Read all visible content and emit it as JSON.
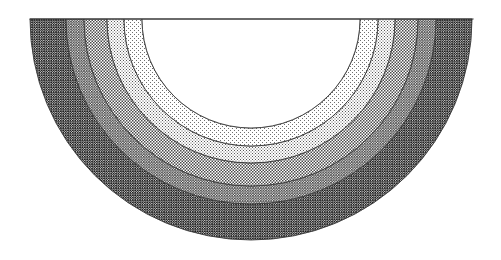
{
  "figure": {
    "title": "Semicircular zoned cross-section",
    "shape": "half-annulus",
    "orientation": "downward half-disc",
    "background_color": "#ffffff",
    "outline_color": "#3a3a3a",
    "center_x": 251,
    "center_y": 19,
    "top_rule_label": "diameter-line",
    "top_rule": {
      "x1": 30,
      "x2": 473,
      "y": 19
    },
    "inner_core": {
      "label": "unshaded inner core",
      "fill": "#ffffff",
      "radius": 109
    },
    "bands": [
      {
        "index": 1,
        "label": "zone-1-lightest",
        "pattern": "sparse-dot",
        "fill_id": "pat-dots-sparse",
        "tone": "#f2f2f2",
        "inner_radius": 109,
        "outer_radius": 127
      },
      {
        "index": 2,
        "label": "zone-2-light",
        "pattern": "fine-dot",
        "fill_id": "pat-dots-fine",
        "tone": "#e0e0e0",
        "inner_radius": 127,
        "outer_radius": 144
      },
      {
        "index": 3,
        "label": "zone-3-medium",
        "pattern": "medium-checker",
        "fill_id": "pat-check-medium",
        "tone": "#c2c2c2",
        "inner_radius": 144,
        "outer_radius": 167
      },
      {
        "index": 4,
        "label": "zone-4-dark",
        "pattern": "dense-checker",
        "fill_id": "pat-check-dense",
        "tone": "#8a8a8a",
        "inner_radius": 167,
        "outer_radius": 185
      },
      {
        "index": 5,
        "label": "zone-5-darkest",
        "pattern": "heavy-checker",
        "fill_id": "pat-check-heavy",
        "tone": "#4a4a4a",
        "inner_radius": 185,
        "outer_radius": 221
      }
    ]
  }
}
